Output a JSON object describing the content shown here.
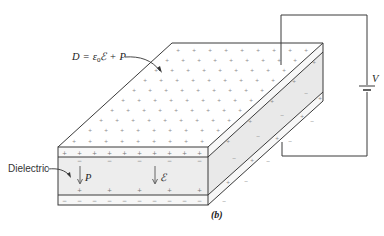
{
  "figure": {
    "caption": "(b)",
    "equation_label": "D = ε₀ℰ + P",
    "equation_parts": {
      "lhs": "D",
      "eq": "=",
      "eps": "ε",
      "sub": "0",
      "E": "ℰ",
      "plus": "+",
      "P": "P"
    },
    "dielectric_label": "Dielectric",
    "polarization_label": "P",
    "field_label": "ℰ",
    "battery_label": "V"
  },
  "colors": {
    "line": "#3a3a3a",
    "dielectric_fill": "#ededed",
    "side_fill": "#e6e6e6",
    "plate_fill": "#f7f7f7",
    "top_fill": "#ffffff",
    "sign": "#777777"
  },
  "charges": {
    "top_plate_front": "+",
    "dielectric_top": "−",
    "dielectric_bottom": "+",
    "bottom_plate_front": "−",
    "top_surface": "+"
  }
}
